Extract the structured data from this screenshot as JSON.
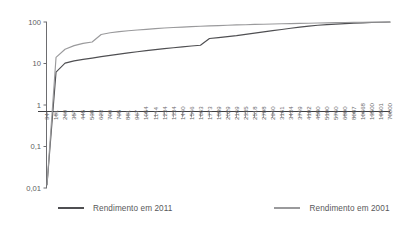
{
  "chart_data": {
    "type": "line",
    "title": "",
    "subtitle": "",
    "xlabel": "",
    "ylabel": "",
    "yscale": "log",
    "ylim": [
      0.01,
      100
    ],
    "ytick_labels": [
      "100",
      "10",
      "1",
      "0,1",
      "0,01"
    ],
    "ytick_values": [
      100,
      10,
      1,
      0.1,
      0.01
    ],
    "grid": false,
    "legend_position": "bottom",
    "baseline_value": 1,
    "categories": [
      "94",
      "181",
      "269",
      "357",
      "445",
      "538",
      "623",
      "709",
      "795",
      "881",
      "967",
      "1054",
      "1144",
      "1234",
      "1334",
      "1440",
      "1546",
      "1663",
      "1773",
      "1889",
      "2029",
      "2169",
      "2335",
      "2518",
      "2708",
      "2940",
      "3161",
      "3434",
      "3749",
      "4102",
      "4580",
      "5100",
      "5760",
      "6800",
      "8087",
      "10668",
      "13500",
      "19501",
      "70000"
    ],
    "xtick_labels": [
      "94",
      "181",
      "269",
      "357",
      "445",
      "538",
      "623",
      "709",
      "795",
      "881",
      "967",
      "1054",
      "1144",
      "1234",
      "1334",
      "1440",
      "1546",
      "1663",
      "1773",
      "1889",
      "2029",
      "2169",
      "2335",
      "2518",
      "2708",
      "2940",
      "3161",
      "3434",
      "3749",
      "4102",
      "4580",
      "5100",
      "5760",
      "6800",
      "8087",
      "10668",
      "13500",
      "19501",
      "70000"
    ],
    "series": [
      {
        "name": "Rendimento em 2011",
        "color": "#4f4f52",
        "values": [
          0.012,
          6.2,
          10.2,
          11.6,
          12.6,
          13.5,
          14.6,
          15.7,
          16.8,
          18.0,
          19.2,
          20.4,
          21.6,
          22.8,
          24.0,
          25.2,
          26.4,
          27.6,
          40.0,
          42.0,
          44.5,
          47.0,
          50.5,
          54.0,
          58.0,
          62.0,
          66.0,
          70.5,
          75.0,
          79.5,
          83.5,
          86.5,
          89.0,
          91.5,
          93.5,
          95.5,
          97.0,
          98.5,
          100.0
        ]
      },
      {
        "name": "Rendimento em 2001",
        "color": "#9a9a9c",
        "values": [
          0.012,
          14.0,
          22.0,
          27.0,
          30.5,
          33.0,
          50.0,
          55.0,
          58.5,
          61.5,
          64.0,
          66.5,
          69.0,
          71.5,
          73.5,
          75.5,
          77.5,
          79.0,
          80.5,
          82.0,
          83.5,
          85.0,
          86.0,
          87.5,
          88.5,
          89.5,
          90.5,
          91.5,
          92.5,
          93.5,
          94.5,
          95.5,
          96.5,
          97.3,
          98.0,
          98.7,
          99.2,
          99.6,
          100.0
        ]
      }
    ]
  },
  "legend": {
    "entries": [
      {
        "label": "Rendimento em 2011",
        "color": "#4f4f52"
      },
      {
        "label": "Rendimento em 2001",
        "color": "#9a9a9c"
      }
    ]
  }
}
